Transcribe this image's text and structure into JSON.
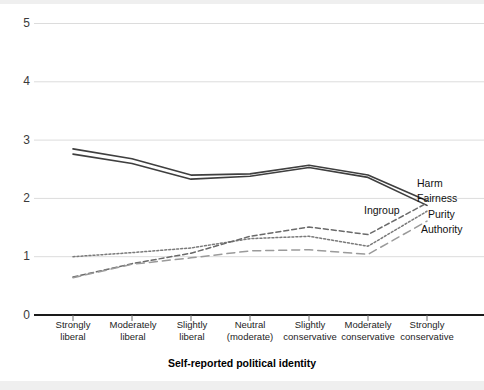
{
  "chart_data": {
    "type": "line",
    "title": "",
    "xlabel": "Self-reported political identity",
    "ylabel": "",
    "ylim": [
      0,
      5
    ],
    "yticks": [
      0,
      1,
      2,
      3,
      4,
      5
    ],
    "grid": true,
    "legend_position": "right-inline",
    "categories": [
      "Strongly liberal",
      "Moderately liberal",
      "Slightly liberal",
      "Neutral (moderate)",
      "Slightly conservative",
      "Moderately conservative",
      "Strongly conservative"
    ],
    "category_lines": [
      [
        "Strongly",
        "liberal"
      ],
      [
        "Moderately",
        "liberal"
      ],
      [
        "Slightly",
        "liberal"
      ],
      [
        "Neutral",
        "(moderate)"
      ],
      [
        "Slightly",
        "conservative"
      ],
      [
        "Moderately",
        "conservative"
      ],
      [
        "Strongly",
        "conservative"
      ]
    ],
    "series": [
      {
        "name": "Harm",
        "style": "solid",
        "color": "#3f3f3f",
        "values": [
          2.85,
          2.68,
          2.4,
          2.42,
          2.57,
          2.4,
          1.96
        ]
      },
      {
        "name": "Fairness",
        "style": "solid",
        "color": "#3f3f3f",
        "values": [
          2.76,
          2.6,
          2.33,
          2.38,
          2.53,
          2.36,
          1.88
        ]
      },
      {
        "name": "Ingroup",
        "style": "dotted",
        "color": "#7a7a7a",
        "values": [
          1.0,
          1.07,
          1.15,
          1.31,
          1.35,
          1.18,
          1.78
        ]
      },
      {
        "name": "Purity",
        "style": "dashed",
        "color": "#6a6a6a",
        "values": [
          0.65,
          0.88,
          1.06,
          1.35,
          1.51,
          1.38,
          1.92
        ]
      },
      {
        "name": "Authority",
        "style": "dash-long",
        "color": "#9a9a9a",
        "values": [
          0.64,
          0.87,
          0.98,
          1.1,
          1.12,
          1.04,
          1.61
        ]
      }
    ],
    "yaxis_labels": [
      "5",
      "4",
      "3",
      "2",
      "1",
      "0"
    ],
    "series_labels": [
      {
        "name": "Harm",
        "x": 417,
        "y": 183
      },
      {
        "name": "Fairness",
        "x": 417,
        "y": 198
      },
      {
        "name": "Ingroup",
        "x": 366,
        "y": 210
      },
      {
        "name": "Purity",
        "x": 430,
        "y": 213
      },
      {
        "name": "Authority",
        "x": 424,
        "y": 228
      }
    ]
  }
}
